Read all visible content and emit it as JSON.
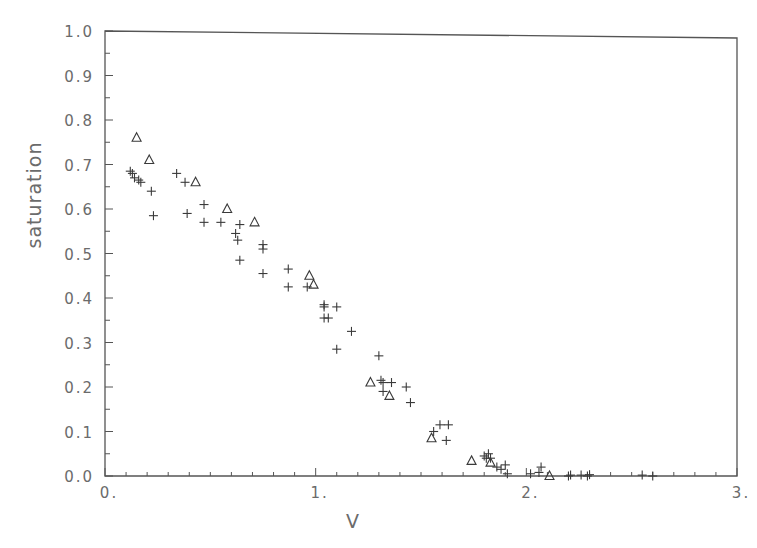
{
  "chart_data": {
    "type": "scatter",
    "title": "",
    "xlabel": "V",
    "ylabel": "saturation",
    "xlim": [
      0,
      3
    ],
    "ylim": [
      0.0,
      1.0
    ],
    "grid": false,
    "legend": null,
    "x_ticks": [
      "0.",
      "1.",
      "2.",
      "3."
    ],
    "y_ticks": [
      "0.0",
      "0.1",
      "0.2",
      "0.3",
      "0.4",
      "0.5",
      "0.6",
      "0.7",
      "0.8",
      "0.9",
      "1.0"
    ],
    "series": [
      {
        "name": "triangles",
        "marker": "triangle",
        "points": [
          [
            0.15,
            0.76
          ],
          [
            0.21,
            0.71
          ],
          [
            0.43,
            0.66
          ],
          [
            0.58,
            0.6
          ],
          [
            0.71,
            0.57
          ],
          [
            0.97,
            0.45
          ],
          [
            0.99,
            0.43
          ],
          [
            1.26,
            0.21
          ],
          [
            1.35,
            0.18
          ],
          [
            1.55,
            0.085
          ],
          [
            1.74,
            0.034
          ],
          [
            1.83,
            0.03
          ],
          [
            2.11,
            0.0
          ]
        ]
      },
      {
        "name": "plus",
        "marker": "plus",
        "points": [
          [
            0.12,
            0.685
          ],
          [
            0.13,
            0.68
          ],
          [
            0.14,
            0.67
          ],
          [
            0.16,
            0.665
          ],
          [
            0.17,
            0.66
          ],
          [
            0.22,
            0.64
          ],
          [
            0.23,
            0.585
          ],
          [
            0.34,
            0.68
          ],
          [
            0.38,
            0.66
          ],
          [
            0.39,
            0.59
          ],
          [
            0.47,
            0.61
          ],
          [
            0.47,
            0.57
          ],
          [
            0.55,
            0.57
          ],
          [
            0.62,
            0.545
          ],
          [
            0.63,
            0.53
          ],
          [
            0.64,
            0.565
          ],
          [
            0.64,
            0.485
          ],
          [
            0.75,
            0.51
          ],
          [
            0.75,
            0.52
          ],
          [
            0.75,
            0.455
          ],
          [
            0.87,
            0.465
          ],
          [
            0.87,
            0.425
          ],
          [
            0.96,
            0.425
          ],
          [
            1.04,
            0.385
          ],
          [
            1.04,
            0.38
          ],
          [
            1.1,
            0.38
          ],
          [
            1.04,
            0.355
          ],
          [
            1.06,
            0.355
          ],
          [
            1.1,
            0.285
          ],
          [
            1.17,
            0.325
          ],
          [
            1.3,
            0.27
          ],
          [
            1.31,
            0.215
          ],
          [
            1.32,
            0.21
          ],
          [
            1.36,
            0.21
          ],
          [
            1.32,
            0.19
          ],
          [
            1.43,
            0.2
          ],
          [
            1.45,
            0.165
          ],
          [
            1.56,
            0.1
          ],
          [
            1.59,
            0.115
          ],
          [
            1.63,
            0.115
          ],
          [
            1.62,
            0.08
          ],
          [
            1.8,
            0.045
          ],
          [
            1.81,
            0.04
          ],
          [
            1.82,
            0.05
          ],
          [
            1.83,
            0.04
          ],
          [
            1.86,
            0.02
          ],
          [
            1.88,
            0.015
          ],
          [
            1.9,
            0.025
          ],
          [
            1.91,
            0.005
          ],
          [
            2.02,
            0.005
          ],
          [
            2.06,
            0.008
          ],
          [
            2.07,
            0.02
          ],
          [
            2.2,
            0.0
          ],
          [
            2.21,
            0.002
          ],
          [
            2.26,
            0.002
          ],
          [
            2.29,
            0.0
          ],
          [
            2.3,
            0.003
          ],
          [
            2.55,
            0.002
          ],
          [
            2.6,
            0.0
          ]
        ]
      }
    ]
  }
}
